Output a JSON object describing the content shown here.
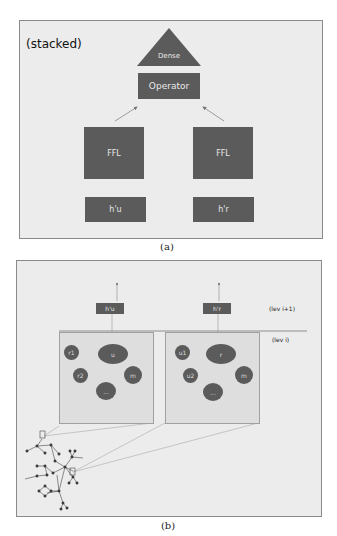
{
  "panel_a": {
    "caption": "(a)",
    "title": "(stacked)",
    "dense_label": "Dense",
    "operator_label": "Operator",
    "ffl_left_label": "FFL",
    "ffl_right_label": "FFL",
    "hu_label": "h'u",
    "hr_label": "h'r"
  },
  "panel_b": {
    "caption": "(b)",
    "level_upper": "(lev i+1)",
    "level_lower": "(lev i)",
    "hu_label": "h'u",
    "hr_label": "h'r",
    "left_box": {
      "center_node": "u",
      "nodes": [
        "r1",
        "r2",
        "m",
        "..."
      ]
    },
    "right_box": {
      "center_node": "r",
      "nodes": [
        "u1",
        "u2",
        "m",
        "..."
      ]
    }
  },
  "colors": {
    "node_fill": "#5b5b5b",
    "panel_bg": "#ececec",
    "subbox_bg": "#dedede"
  }
}
